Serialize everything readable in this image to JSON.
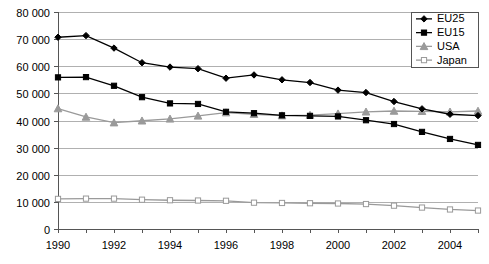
{
  "chart_data": {
    "type": "line",
    "title": "",
    "subtitle": "",
    "xlabel": "",
    "ylabel": "",
    "x": [
      1990,
      1991,
      1992,
      1993,
      1994,
      1995,
      1996,
      1997,
      1998,
      1999,
      2000,
      2001,
      2002,
      2003,
      2004,
      2005
    ],
    "xlim": [
      1990,
      2005
    ],
    "ylim": [
      0,
      80000
    ],
    "ytick_values": [
      0,
      10000,
      20000,
      30000,
      40000,
      50000,
      60000,
      70000,
      80000
    ],
    "ytick_labels": [
      "0",
      "10 000",
      "20 000",
      "30 000",
      "40 000",
      "50 000",
      "60 000",
      "70 000",
      "80 000"
    ],
    "xtick_labels": [
      "1990",
      "1992",
      "1994",
      "1996",
      "1998",
      "2000",
      "2002",
      "2004"
    ],
    "xtick_values": [
      1990,
      1992,
      1994,
      1996,
      1998,
      2000,
      2002,
      2004
    ],
    "grid": true,
    "grid_axis": "y",
    "legend_position": "top-right",
    "series": [
      {
        "name": "EU25",
        "marker": "diamond",
        "color": "#000000",
        "values": [
          70700,
          71300,
          66700,
          61300,
          59700,
          59100,
          55600,
          56800,
          55000,
          54000,
          51200,
          50300,
          47000,
          44300,
          42300,
          41800
        ]
      },
      {
        "name": "EU15",
        "marker": "square",
        "color": "#000000",
        "values": [
          55900,
          56000,
          52800,
          48600,
          46300,
          46100,
          43200,
          42700,
          41900,
          41700,
          41500,
          40100,
          38700,
          35800,
          33200,
          31000
        ]
      },
      {
        "name": "USA",
        "marker": "triangle",
        "color": "#9a9a9a",
        "values": [
          44400,
          41300,
          39200,
          39900,
          40600,
          41700,
          42900,
          42300,
          41800,
          42000,
          42500,
          43200,
          43500,
          43400,
          43200,
          43500
        ]
      },
      {
        "name": "Japan",
        "marker": "open-square",
        "color": "#9a9a9a",
        "values": [
          11100,
          11200,
          11200,
          10800,
          10600,
          10500,
          10400,
          9700,
          9600,
          9500,
          9400,
          9200,
          8600,
          7900,
          7200,
          6800
        ]
      }
    ]
  },
  "legend": {
    "entries": [
      {
        "label": "EU25"
      },
      {
        "label": "EU15"
      },
      {
        "label": "USA"
      },
      {
        "label": "Japan"
      }
    ]
  }
}
